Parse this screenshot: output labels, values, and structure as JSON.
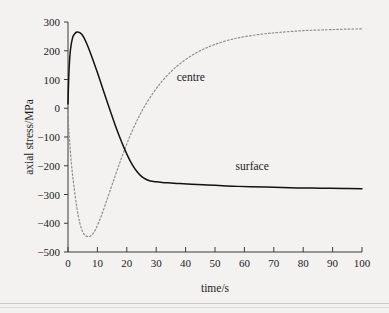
{
  "chart_data": {
    "type": "line",
    "title": "",
    "xlabel": "time/s",
    "ylabel": "axial stress/MPa",
    "xlim": [
      0,
      100
    ],
    "ylim": [
      -500,
      300
    ],
    "grid": false,
    "legend": "inline-annotations",
    "xticks": [
      0,
      10,
      20,
      30,
      40,
      50,
      60,
      70,
      80,
      90,
      100
    ],
    "xtick_labels": [
      "0",
      "10",
      "20",
      "30",
      "40",
      "50",
      "60",
      "70",
      "80",
      "90",
      "100"
    ],
    "yticks": [
      300,
      200,
      100,
      0,
      -100,
      -200,
      -300,
      -400,
      -500
    ],
    "ytick_labels": [
      "300",
      "200",
      "100",
      "0",
      "−100",
      "−200",
      "−300",
      "−400",
      "−500"
    ],
    "series": [
      {
        "name": "surface",
        "style": "solid",
        "color": "#111111",
        "annotation": "surface",
        "annotation_x": 57,
        "annotation_y": -215,
        "x": [
          0,
          0.3,
          0.8,
          1.5,
          2.2,
          3,
          3.8,
          4.6,
          5.5,
          6.5,
          7.5,
          8.5,
          10,
          11.5,
          13,
          14.5,
          16,
          17.5,
          19,
          20.5,
          22,
          23.5,
          25,
          26.5,
          28,
          30,
          32,
          35,
          38,
          42,
          46,
          50,
          56,
          62,
          70,
          78,
          86,
          94,
          100
        ],
        "y": [
          15,
          120,
          200,
          243,
          258,
          265,
          264,
          258,
          244,
          222,
          196,
          168,
          124,
          78,
          32,
          -13,
          -57,
          -98,
          -136,
          -170,
          -199,
          -221,
          -237,
          -247,
          -253,
          -256,
          -258,
          -260,
          -262,
          -264,
          -266,
          -268,
          -271,
          -273,
          -275,
          -277,
          -278,
          -279,
          -280
        ]
      },
      {
        "name": "centre",
        "style": "dotted",
        "color": "#8d8d8d",
        "annotation": "centre",
        "annotation_x": 37,
        "annotation_y": 95,
        "x": [
          0,
          0.5,
          1.2,
          2,
          3,
          4,
          5,
          6,
          7,
          7.6,
          8.5,
          9.5,
          11,
          12.5,
          14,
          16,
          18,
          20,
          22,
          24,
          26,
          29,
          32,
          35,
          38,
          42,
          46,
          50,
          55,
          60,
          66,
          72,
          80,
          88,
          94,
          100
        ],
        "y": [
          -30,
          -108,
          -196,
          -270,
          -345,
          -398,
          -430,
          -444,
          -446,
          -445,
          -436,
          -419,
          -383,
          -341,
          -296,
          -236,
          -178,
          -124,
          -75,
          -32,
          6,
          54,
          94,
          127,
          154,
          183,
          205,
          222,
          238,
          249,
          258,
          264,
          270,
          273,
          275,
          276
        ]
      }
    ]
  },
  "figure": {
    "background_color": "#f3f2f0",
    "axis_color": "#3a3a3a"
  }
}
